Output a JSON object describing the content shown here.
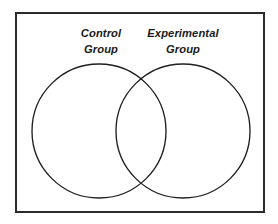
{
  "figure": {
    "type": "venn-diagram",
    "background_color": "#ffffff",
    "frame": {
      "name": "outer-border",
      "stroke_color": "#2b2b2b",
      "stroke_width": 2,
      "x": 16,
      "y": 13,
      "width": 248,
      "height": 199
    },
    "circles": [
      {
        "id": "control",
        "label_lines": [
          "Control",
          "Group"
        ],
        "cx": 99,
        "cy": 131,
        "r": 67,
        "stroke_color": "#1f1f1f",
        "fill": "none"
      },
      {
        "id": "experimental",
        "label_lines": [
          "Experimental",
          "Group"
        ],
        "cx": 183,
        "cy": 131,
        "r": 67,
        "stroke_color": "#1f1f1f",
        "fill": "none"
      }
    ],
    "labels": {
      "control": {
        "line1": "Control",
        "line2": "Group",
        "x": 101,
        "y1": 37,
        "y2": 53
      },
      "experimental": {
        "line1": "Experimental",
        "line2": "Group",
        "x": 183,
        "y1": 37,
        "y2": 53
      }
    }
  }
}
